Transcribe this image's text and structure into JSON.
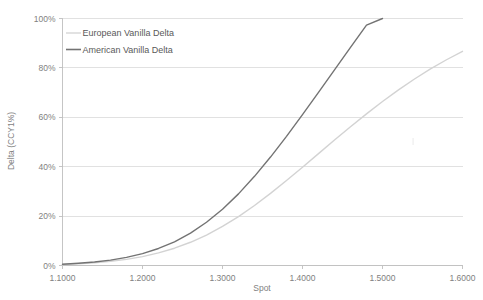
{
  "chart_data": {
    "type": "line",
    "title": "",
    "xlabel": "Spot",
    "ylabel": "Delta (CCY1%)",
    "xlim": [
      1.1,
      1.6
    ],
    "ylim": [
      0,
      100
    ],
    "grid": true,
    "legend_position": "top-left-inside",
    "x_ticks": [
      "1.1000",
      "1.2000",
      "1.3000",
      "1.4000",
      "1.5000",
      "1.6000"
    ],
    "x_tick_values": [
      1.1,
      1.2,
      1.3,
      1.4,
      1.5,
      1.6
    ],
    "y_ticks": [
      "0%",
      "20%",
      "40%",
      "60%",
      "80%",
      "100%"
    ],
    "y_tick_values": [
      0,
      20,
      40,
      60,
      80,
      100
    ],
    "x": [
      1.1,
      1.12,
      1.14,
      1.16,
      1.18,
      1.2,
      1.22,
      1.24,
      1.26,
      1.28,
      1.3,
      1.32,
      1.34,
      1.36,
      1.38,
      1.4,
      1.42,
      1.44,
      1.46,
      1.48,
      1.5,
      1.52,
      1.54,
      1.56,
      1.58,
      1.6
    ],
    "series": [
      {
        "name": "European Vanilla Delta",
        "color": "#d3d3d3",
        "width": 1.4,
        "values": [
          0.4,
          0.7,
          1.1,
          1.7,
          2.5,
          3.6,
          5.1,
          7.0,
          9.4,
          12.3,
          15.8,
          19.8,
          24.3,
          29.2,
          34.4,
          39.8,
          45.3,
          50.8,
          56.2,
          61.4,
          66.4,
          71.1,
          75.5,
          79.6,
          83.3,
          86.7
        ]
      },
      {
        "name": "American Vanilla Delta",
        "color": "#737373",
        "width": 1.4,
        "values": [
          0.5,
          0.9,
          1.4,
          2.2,
          3.3,
          4.8,
          6.9,
          9.6,
          13.1,
          17.5,
          22.8,
          29.0,
          36.1,
          43.9,
          52.3,
          61.1,
          70.1,
          79.2,
          88.3,
          97.3,
          100.0,
          100.0,
          100.0,
          100.0,
          100.0,
          100.0
        ]
      }
    ],
    "legend": [
      {
        "label": "European Vanilla Delta",
        "color": "#d3d3d3"
      },
      {
        "label": "American Vanilla Delta",
        "color": "#737373"
      }
    ]
  }
}
